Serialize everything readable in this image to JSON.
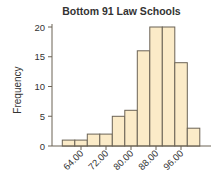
{
  "chart_data": {
    "type": "bar",
    "subtype": "histogram",
    "title": "Bottom 91 Law Schools",
    "xlabel": "",
    "ylabel": "Frequency",
    "bin_width": 4,
    "bins": [
      {
        "start": 58,
        "end": 62,
        "count": 1
      },
      {
        "start": 62,
        "end": 66,
        "count": 1
      },
      {
        "start": 66,
        "end": 70,
        "count": 2
      },
      {
        "start": 70,
        "end": 74,
        "count": 2
      },
      {
        "start": 74,
        "end": 78,
        "count": 5
      },
      {
        "start": 78,
        "end": 82,
        "count": 6
      },
      {
        "start": 82,
        "end": 86,
        "count": 16
      },
      {
        "start": 86,
        "end": 90,
        "count": 20
      },
      {
        "start": 90,
        "end": 94,
        "count": 20
      },
      {
        "start": 94,
        "end": 98,
        "count": 14
      },
      {
        "start": 98,
        "end": 102,
        "count": 3
      }
    ],
    "categories": [
      "58-62",
      "62-66",
      "66-70",
      "70-74",
      "74-78",
      "78-82",
      "82-86",
      "86-90",
      "90-94",
      "94-98",
      "98-102"
    ],
    "values": [
      1,
      1,
      2,
      2,
      5,
      6,
      16,
      20,
      20,
      14,
      3
    ],
    "x_ticks": [
      "64.00",
      "72.00",
      "80.00",
      "88.00",
      "96.00"
    ],
    "x_tick_values": [
      64,
      72,
      80,
      88,
      96
    ],
    "y_ticks": [
      "0",
      "5",
      "10",
      "15",
      "20"
    ],
    "y_tick_values": [
      0,
      5,
      10,
      15,
      20
    ],
    "xlim": [
      54,
      106
    ],
    "ylim": [
      0,
      20
    ],
    "grid": false,
    "legend": null,
    "colors": {
      "bar_fill": "#fbebc8",
      "bar_edge": "#6b6355"
    }
  }
}
